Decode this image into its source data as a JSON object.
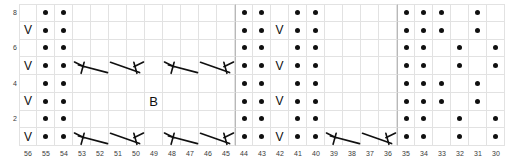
{
  "chart_data": {
    "type": "table",
    "title": "",
    "xlabel": "",
    "ylabel": "",
    "grid": true,
    "columns": [
      56,
      55,
      54,
      53,
      52,
      51,
      50,
      49,
      48,
      47,
      46,
      45,
      44,
      43,
      42,
      41,
      40,
      39,
      38,
      37,
      36,
      35,
      34,
      33,
      32,
      31,
      30
    ],
    "rows": [
      8,
      7,
      6,
      5,
      4,
      3,
      2,
      1
    ],
    "row_tick_labels": [
      "8",
      "",
      "6",
      "",
      "4",
      "",
      "2",
      ""
    ],
    "column_tick_labels": [
      "56",
      "55",
      "54",
      "53",
      "52",
      "51",
      "50",
      "49",
      "48",
      "47",
      "46",
      "45",
      "44",
      "43",
      "42",
      "41",
      "40",
      "39",
      "38",
      "37",
      "36",
      "35",
      "34",
      "33",
      "32",
      "31",
      "30"
    ],
    "legend": [
      {
        "symbol": "dot",
        "name": "purl-dot"
      },
      {
        "symbol": "V",
        "name": "slip-stitch-vee"
      },
      {
        "symbol": "B",
        "name": "bobble"
      },
      {
        "symbol": "decrease",
        "name": "paired-decrease-lines"
      }
    ],
    "section_separators_after_columns": [
      45,
      36
    ],
    "cells": {
      "dots": [
        {
          "row": 8,
          "cols": [
            55,
            54,
            44,
            43,
            41,
            40,
            35,
            34,
            33,
            31
          ]
        },
        {
          "row": 7,
          "cols": [
            55,
            54,
            44,
            43,
            41,
            40,
            35,
            34,
            33,
            31
          ]
        },
        {
          "row": 6,
          "cols": [
            55,
            54,
            44,
            43,
            41,
            40,
            35,
            34,
            32,
            30
          ]
        },
        {
          "row": 5,
          "cols": [
            55,
            54,
            44,
            43,
            41,
            40,
            35,
            34,
            32,
            30
          ]
        },
        {
          "row": 4,
          "cols": [
            55,
            54,
            44,
            43,
            41,
            40,
            35,
            34,
            33,
            31
          ]
        },
        {
          "row": 3,
          "cols": [
            55,
            54,
            44,
            43,
            41,
            40,
            35,
            34,
            33,
            31
          ]
        },
        {
          "row": 2,
          "cols": [
            55,
            54,
            44,
            43,
            41,
            40,
            35,
            34,
            32,
            30
          ]
        },
        {
          "row": 1,
          "cols": [
            55,
            54,
            44,
            43,
            41,
            40,
            35,
            34,
            32,
            30
          ]
        }
      ],
      "vees": [
        {
          "row": 7,
          "cols": [
            56,
            42
          ]
        },
        {
          "row": 5,
          "cols": [
            56,
            42
          ]
        },
        {
          "row": 3,
          "cols": [
            56,
            42
          ]
        },
        {
          "row": 1,
          "cols": [
            56,
            42
          ]
        }
      ],
      "bobbles": [
        {
          "row": 3,
          "col": 49,
          "label": "B"
        }
      ],
      "decreases": [
        {
          "row": 5,
          "start_col": 53,
          "kind": "left"
        },
        {
          "row": 5,
          "start_col": 51,
          "kind": "right"
        },
        {
          "row": 5,
          "start_col": 48,
          "kind": "left"
        },
        {
          "row": 5,
          "start_col": 46,
          "kind": "right"
        },
        {
          "row": 1,
          "start_col": 53,
          "kind": "left"
        },
        {
          "row": 1,
          "start_col": 51,
          "kind": "right"
        },
        {
          "row": 1,
          "start_col": 48,
          "kind": "left"
        },
        {
          "row": 1,
          "start_col": 46,
          "kind": "right"
        },
        {
          "row": 1,
          "start_col": 39,
          "kind": "left"
        },
        {
          "row": 1,
          "start_col": 37,
          "kind": "right"
        }
      ]
    }
  }
}
